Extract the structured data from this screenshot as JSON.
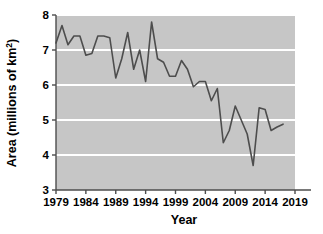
{
  "chart_data": {
    "type": "line",
    "title": "",
    "xlabel": "Year",
    "ylabel": "Area (millions of km²)",
    "ylabel_base": "Area (millions of km",
    "ylabel_sup": "2",
    "ylabel_tail": ")",
    "xlim": [
      1979,
      2019
    ],
    "ylim": [
      3,
      8
    ],
    "grid": "horizontal-white",
    "legend": "none",
    "plot_bg": "#c6c6c6",
    "line_color": "#4d4d4d",
    "line_width": 1.6,
    "xticks": [
      1979,
      1984,
      1989,
      1994,
      1999,
      2004,
      2009,
      2014,
      2019
    ],
    "xtick_labels": [
      "1979",
      "1984",
      "1989",
      "1994",
      "1999",
      "2004",
      "2009",
      "2014",
      "2019"
    ],
    "yticks": [
      3,
      4,
      5,
      6,
      7,
      8
    ],
    "ytick_labels": [
      "3",
      "4",
      "5",
      "6",
      "7",
      "8"
    ],
    "x": [
      1979,
      1980,
      1981,
      1982,
      1983,
      1984,
      1985,
      1986,
      1987,
      1988,
      1989,
      1990,
      1991,
      1992,
      1993,
      1994,
      1995,
      1996,
      1997,
      1998,
      1999,
      2000,
      2001,
      2002,
      2003,
      2004,
      2005,
      2006,
      2007,
      2008,
      2009,
      2010,
      2011,
      2012,
      2013,
      2014,
      2015,
      2016,
      2017
    ],
    "values": [
      7.2,
      7.7,
      7.15,
      7.4,
      7.4,
      6.85,
      6.9,
      7.4,
      7.4,
      7.35,
      6.2,
      6.75,
      7.5,
      6.45,
      7.0,
      6.1,
      7.8,
      6.75,
      6.65,
      6.25,
      6.25,
      6.7,
      6.45,
      5.95,
      6.1,
      6.1,
      5.55,
      5.9,
      4.35,
      4.7,
      5.4,
      5.0,
      4.6,
      3.7,
      5.35,
      5.3,
      4.7,
      4.8,
      4.88
    ],
    "series_name": "Sea ice area"
  },
  "chart_meta": {
    "x_axis_title": "Year",
    "y_axis_title_full": "Area (millions of km2)"
  }
}
